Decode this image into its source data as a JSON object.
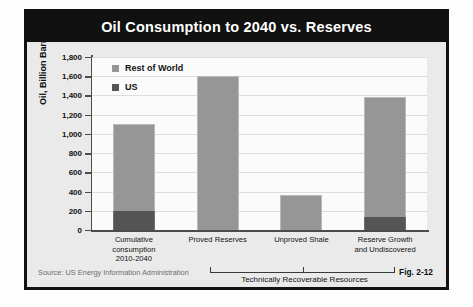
{
  "figure": {
    "title": "Oil Consumption to 2040 vs. Reserves",
    "source_label": "Source:  US Energy Information Administration",
    "figure_number": "Fig. 2-12",
    "bracket_label": "Technically Recoverable Resources"
  },
  "colors": {
    "rest_of_world": "#969696",
    "us": "#555555",
    "title_bar": "#111111",
    "panel": "#eaeaea",
    "plot": "#fbfbfb"
  },
  "chart_data": {
    "type": "bar",
    "title": "Oil Consumption to 2040 vs. Reserves",
    "xlabel": "",
    "ylabel": "Oil, Billion Barrels",
    "ylim": [
      0,
      1800
    ],
    "ytick_step": 200,
    "grid": true,
    "stacked": true,
    "legend_position": "top-left",
    "categories": [
      "Cumulative\nconsumption\n2010-2040",
      "Proved Reserves",
      "Unproved Shale",
      "Reserve Growth\nand Undiscovered"
    ],
    "category_lines": [
      [
        "Cumulative",
        "consumption",
        "2010-2040"
      ],
      [
        "Proved Reserves"
      ],
      [
        "Unproved Shale"
      ],
      [
        "Reserve Growth",
        "and Undiscovered"
      ]
    ],
    "series": [
      {
        "name": "US",
        "color": "#555555",
        "values": [
          200,
          0,
          0,
          140
        ]
      },
      {
        "name": "Rest of World",
        "color": "#969696",
        "values": [
          900,
          1600,
          365,
          1240
        ]
      }
    ],
    "totals": [
      1100,
      1600,
      365,
      1380
    ],
    "ytick_labels": [
      "1,800",
      "1,600",
      "1,400",
      "1,200",
      "1,000",
      "800",
      "600",
      "400",
      "200",
      "0"
    ],
    "ytick_values": [
      1800,
      1600,
      1400,
      1200,
      1000,
      800,
      600,
      400,
      200,
      0
    ],
    "annotations": [
      {
        "text": "Technically Recoverable Resources",
        "covers": [
          "Proved Reserves",
          "Unproved Shale",
          "Reserve Growth and Undiscovered"
        ]
      }
    ]
  }
}
